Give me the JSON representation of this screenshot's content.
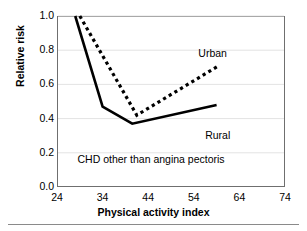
{
  "chart_data": {
    "type": "line",
    "title": "",
    "subtitle": "",
    "xlabel": "Physical activity index",
    "ylabel": "Relative risk",
    "xlim": [
      24,
      74
    ],
    "ylim": [
      0.0,
      1.0
    ],
    "xticks": [
      24,
      34,
      44,
      54,
      64,
      74
    ],
    "xtick_labels": [
      "24",
      "34",
      "44",
      "54",
      "64",
      "74"
    ],
    "yticks": [
      0.0,
      0.2,
      0.4,
      0.6,
      0.8,
      1.0
    ],
    "ytick_labels": [
      "0.0",
      "0.2",
      "0.4",
      "0.6",
      "0.8",
      "1.0"
    ],
    "grid": "horizontal",
    "legend_position": "inline-annotations",
    "annotations": [
      {
        "name": "condition-note",
        "text": "CHD other than angina pectoris",
        "x": 28.5,
        "y": 0.16
      }
    ],
    "series": [
      {
        "name": "Rural",
        "style": "solid",
        "color": "#000000",
        "label_x": 56.5,
        "label_y": 0.3,
        "points": [
          {
            "x": 28.0,
            "y": 1.0
          },
          {
            "x": 34.0,
            "y": 0.47
          },
          {
            "x": 40.5,
            "y": 0.37
          },
          {
            "x": 59.0,
            "y": 0.48
          }
        ]
      },
      {
        "name": "Urban",
        "style": "dotted",
        "color": "#000000",
        "label_x": 55.0,
        "label_y": 0.78,
        "points": [
          {
            "x": 29.0,
            "y": 1.0
          },
          {
            "x": 41.5,
            "y": 0.42
          },
          {
            "x": 59.5,
            "y": 0.71
          }
        ]
      }
    ]
  },
  "figure": {
    "background_color": "#ffffff",
    "frame_color": "#6f6f6f",
    "gridline_color": "#e3e3e3",
    "rule_color": "#8a8a8a"
  }
}
